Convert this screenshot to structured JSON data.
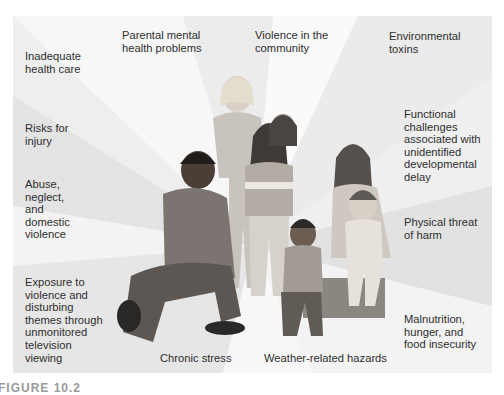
{
  "diagram": {
    "type": "radial-factors-around-family",
    "center": "Illustration of a family group: kneeling adult man, standing girls, seated woman holding toddler, seated young boy",
    "colors": {
      "panel_bg": "#f1f1f1",
      "ray_light": "#f9f9f9",
      "ray_dark": "#e2e2e2",
      "text": "#2e2e2e"
    },
    "labels": {
      "inadequate_health_care": [
        "Inadequate",
        "health care"
      ],
      "parental_mental_health": [
        "Parental mental",
        "health problems"
      ],
      "violence_community": [
        "Violence in the",
        "community"
      ],
      "environmental_toxins": [
        "Environmental",
        "toxins"
      ],
      "risks_injury": [
        "Risks for",
        "injury"
      ],
      "functional_challenges": [
        "Functional",
        "challenges",
        "associated with",
        "unidentified",
        "developmental",
        "delay"
      ],
      "abuse": [
        "Abuse,",
        "neglect,",
        "and",
        "domestic",
        "violence"
      ],
      "physical_threat": [
        "Physical threat",
        "of harm"
      ],
      "exposure_tv": [
        "Exposure to",
        "violence and",
        "disturbing",
        "themes through",
        "unmonitored",
        "television",
        "viewing"
      ],
      "malnutrition": [
        "Malnutrition,",
        "hunger, and",
        "food insecurity"
      ],
      "chronic_stress": [
        "Chronic stress"
      ],
      "weather_hazards": [
        "Weather-related hazards"
      ]
    }
  },
  "caption": "FIGURE 10.2"
}
